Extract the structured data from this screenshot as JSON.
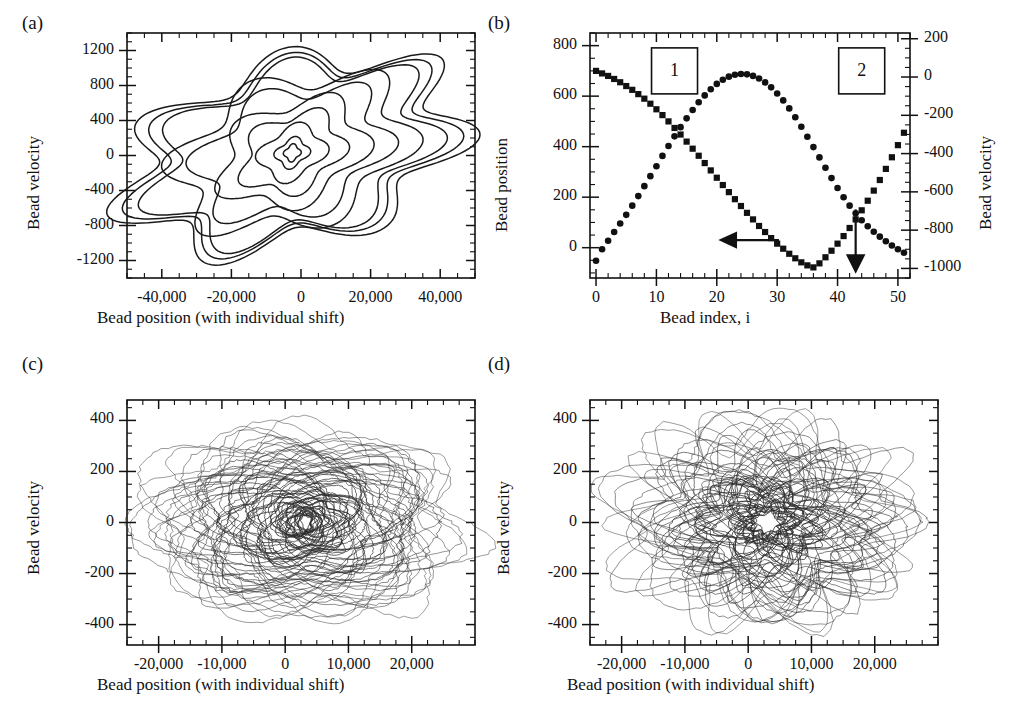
{
  "figure": {
    "panels": [
      "a",
      "b",
      "c",
      "d"
    ],
    "line_color": "#2b2b2b",
    "marker_color": "#111111"
  },
  "panel_a": {
    "letter": "(a)",
    "xlabel": "Bead position (with individual shift)",
    "ylabel": "Bead velocity",
    "xticks": [
      "-40,000",
      "-20,000",
      "0",
      "20,000",
      "40,000"
    ],
    "yticks": [
      "1200",
      "800",
      "400",
      "0",
      "-400",
      "-800",
      "-1200"
    ]
  },
  "panel_b": {
    "letter": "(b)",
    "xlabel": "Bead index, i",
    "ylabel_left": "Bead position",
    "ylabel_right": "Bead velocity",
    "xticks": [
      "0",
      "10",
      "20",
      "30",
      "40",
      "50"
    ],
    "yticks_left": [
      "800",
      "600",
      "400",
      "200",
      "0"
    ],
    "yticks_right": [
      "200",
      "0",
      "-200",
      "-400",
      "-600",
      "-800",
      "-1000"
    ],
    "annotation_box_1": "1",
    "annotation_box_2": "2",
    "arrow_left_label": "left-axis-arrow",
    "arrow_down_label": "right-axis-arrow"
  },
  "panel_c": {
    "letter": "(c)",
    "xlabel": "Bead position (with individual shift)",
    "ylabel": "Bead velocity",
    "xticks": [
      "-20,000",
      "-10,000",
      "0",
      "10,000",
      "20,000"
    ],
    "yticks": [
      "400",
      "200",
      "0",
      "-200",
      "-400"
    ]
  },
  "panel_d": {
    "letter": "(d)",
    "xlabel": "Bead position (with individual shift)",
    "ylabel": "Bead velocity",
    "xticks": [
      "-20,000",
      "-10,000",
      "0",
      "10,000",
      "20,000"
    ],
    "yticks": [
      "400",
      "200",
      "0",
      "-200",
      "-400"
    ]
  },
  "chart_data": [
    {
      "id": "panel_a",
      "type": "line",
      "title": "(a)",
      "xlabel": "Bead position (with individual shift)",
      "ylabel": "Bead velocity",
      "xlim": [
        -50000,
        50000
      ],
      "ylim": [
        -1400,
        1400
      ],
      "xticks": [
        -40000,
        -20000,
        0,
        20000,
        40000
      ],
      "yticks": [
        1200,
        800,
        400,
        0,
        -400,
        -800,
        -1200
      ],
      "x_minor_interval": 5000,
      "y_minor_interval": 100,
      "grid": false,
      "legend": false,
      "description": "Nested closed phase-space loops (position vs velocity), largest loop spanning approximately -44,000 to 48,000 in position and -1050 to 1100 in velocity, contracting inward to a small four-pointed star near the origin.",
      "series": [
        {
          "name": "loop-1-outer",
          "amp_x": 46000,
          "amp_y": 1090,
          "n_lobes": 7,
          "skew": 0.3
        },
        {
          "name": "loop-2",
          "amp_x": 42000,
          "amp_y": 1030,
          "n_lobes": 7,
          "skew": 0.3
        },
        {
          "name": "loop-3",
          "amp_x": 38000,
          "amp_y": 980,
          "n_lobes": 7,
          "skew": 0.29
        },
        {
          "name": "loop-4",
          "amp_x": 32000,
          "amp_y": 870,
          "n_lobes": 6,
          "skew": 0.28
        },
        {
          "name": "loop-5",
          "amp_x": 26000,
          "amp_y": 740,
          "n_lobes": 6,
          "skew": 0.27
        },
        {
          "name": "loop-6",
          "amp_x": 20000,
          "amp_y": 600,
          "n_lobes": 5,
          "skew": 0.25
        },
        {
          "name": "loop-7",
          "amp_x": 14000,
          "amp_y": 450,
          "n_lobes": 5,
          "skew": 0.23
        },
        {
          "name": "loop-8",
          "amp_x": 9000,
          "amp_y": 300,
          "n_lobes": 4,
          "skew": 0.2
        },
        {
          "name": "loop-9-inner",
          "amp_x": 4500,
          "amp_y": 160,
          "n_lobes": 4,
          "skew": 0.16
        },
        {
          "name": "loop-10-star",
          "amp_x": 2200,
          "amp_y": 90,
          "n_lobes": 4,
          "skew": 0.1
        }
      ]
    },
    {
      "id": "panel_b",
      "type": "scatter",
      "title": "(b)",
      "xlabel": "Bead index, i",
      "ylabel": "Bead position",
      "ylabel2": "Bead velocity",
      "xlim": [
        -1,
        52
      ],
      "ylim": [
        -120,
        850
      ],
      "ylim2": [
        -1050,
        230
      ],
      "xticks": [
        0,
        10,
        20,
        30,
        40,
        50
      ],
      "yticks": [
        800,
        600,
        400,
        200,
        0
      ],
      "yticks2": [
        200,
        0,
        -200,
        -400,
        -600,
        -800,
        -1000
      ],
      "x_minor_interval": 2,
      "grid": false,
      "annotations": [
        {
          "label": "1",
          "x": 13,
          "y": 700,
          "type": "box"
        },
        {
          "label": "2",
          "x": 44,
          "y": 700,
          "type": "box"
        },
        {
          "label": "left-arrow",
          "x": 24,
          "y": 30,
          "type": "arrow-left",
          "points_to": "left-axis"
        },
        {
          "label": "down-arrow",
          "x": 43,
          "y": 120,
          "type": "arrow-down",
          "points_to": "right-axis"
        }
      ],
      "x": [
        0,
        1,
        2,
        3,
        4,
        5,
        6,
        7,
        8,
        9,
        10,
        11,
        12,
        13,
        14,
        15,
        16,
        17,
        18,
        19,
        20,
        21,
        22,
        23,
        24,
        25,
        26,
        27,
        28,
        29,
        30,
        31,
        32,
        33,
        34,
        35,
        36,
        37,
        38,
        39,
        40,
        41,
        42,
        43,
        44,
        45,
        46,
        47,
        48,
        49,
        50,
        51
      ],
      "series": [
        {
          "name": "bead-position-squares",
          "axis": "left",
          "marker": "square",
          "values": [
            700,
            690,
            680,
            668,
            655,
            640,
            625,
            608,
            590,
            570,
            548,
            525,
            500,
            474,
            448,
            420,
            392,
            364,
            335,
            306,
            277,
            248,
            220,
            192,
            165,
            138,
            112,
            86,
            62,
            38,
            16,
            -4,
            -24,
            -42,
            -58,
            -70,
            -78,
            -62,
            -38,
            -12,
            16,
            46,
            78,
            112,
            148,
            186,
            226,
            268,
            312,
            358,
            406,
            455
          ]
        },
        {
          "name": "bead-velocity-circles",
          "axis": "right",
          "marker": "circle",
          "values": [
            -960,
            -900,
            -855,
            -810,
            -765,
            -720,
            -672,
            -622,
            -570,
            -518,
            -466,
            -412,
            -360,
            -310,
            -262,
            -216,
            -172,
            -132,
            -96,
            -64,
            -36,
            -14,
            2,
            12,
            16,
            14,
            6,
            -8,
            -28,
            -54,
            -86,
            -122,
            -164,
            -210,
            -260,
            -312,
            -366,
            -420,
            -474,
            -528,
            -580,
            -628,
            -672,
            -712,
            -748,
            -780,
            -808,
            -834,
            -858,
            -880,
            -900,
            -918
          ]
        }
      ]
    },
    {
      "id": "panel_c",
      "type": "line",
      "title": "(c)",
      "xlabel": "Bead position (with individual shift)",
      "ylabel": "Bead velocity",
      "xlim": [
        -25000,
        30000
      ],
      "ylim": [
        -480,
        480
      ],
      "xticks": [
        -20000,
        -10000,
        0,
        10000,
        20000
      ],
      "yticks": [
        400,
        200,
        0,
        -200,
        -400
      ],
      "x_minor_interval": 2500,
      "y_minor_interval": 50,
      "grid": false,
      "legend": false,
      "description": "Dense tangle of many overlapping phase-space loops centered near x=3000, with two dark high-density lobes near x=0 and x=6000 at velocity 0; outer excursions reach +420 and -360 in velocity and -22,000 to 27,000 in position.",
      "loop_count": 70,
      "center_x": 3000,
      "dark_lobes_x": [
        500,
        6500
      ]
    },
    {
      "id": "panel_d",
      "type": "line",
      "title": "(d)",
      "xlabel": "Bead position (with individual shift)",
      "ylabel": "Bead velocity",
      "xlim": [
        -25000,
        30000
      ],
      "ylim": [
        -480,
        480
      ],
      "xticks": [
        -20000,
        -10000,
        0,
        10000,
        20000
      ],
      "yticks": [
        400,
        200,
        0,
        -200,
        -400
      ],
      "x_minor_interval": 2500,
      "y_minor_interval": 50,
      "grid": false,
      "legend": false,
      "description": "Tangle of overlapping loops with several distinct concentric loop families visible between x=-10,000 and x=15,000; outer excursions reach +430 and -390 in velocity and -19,000 to 24,000 in position.",
      "loop_count": 55,
      "center_x": 2500,
      "lobe_centers_x": [
        -6000,
        -2000,
        2000,
        6000,
        10000
      ]
    }
  ]
}
